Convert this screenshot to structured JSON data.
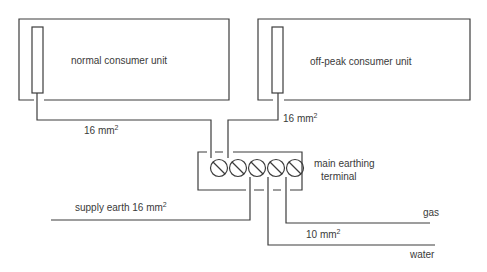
{
  "diagram": {
    "type": "earthing-wiring-diagram",
    "consumer_units": [
      {
        "label": "normal consumer unit",
        "conductor_size": "16 mm",
        "conductor_sup": "2"
      },
      {
        "label": "off-peak consumer unit",
        "conductor_size": "16 mm",
        "conductor_sup": "2"
      }
    ],
    "terminal": {
      "label_line1": "main earthing",
      "label_line2": "terminal",
      "screw_count": 5
    },
    "connections": {
      "supply_earth": {
        "label": "supply earth 16 mm",
        "sup": "2"
      },
      "bonding_size": {
        "label": "10 mm",
        "sup": "2"
      },
      "gas": {
        "label": "gas"
      },
      "water": {
        "label": "water"
      }
    },
    "colors": {
      "line": "#3c3c3c",
      "text": "#3a3a3a",
      "background": "#ffffff"
    }
  }
}
